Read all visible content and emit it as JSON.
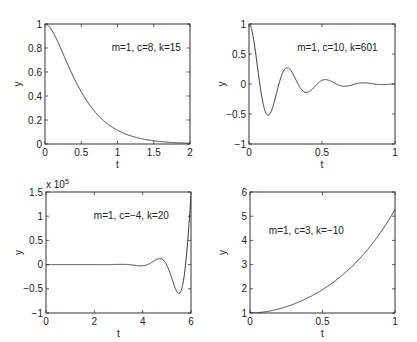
{
  "chart_data": [
    {
      "type": "line",
      "annotation": "m=1, c=8, k=15",
      "xlabel": "t",
      "ylabel": "y",
      "xlim": [
        0,
        2
      ],
      "ylim": [
        0,
        1
      ],
      "xticks": [
        "0",
        "0.5",
        "1",
        "1.5",
        "2"
      ],
      "yticks": [
        "0",
        "0.2",
        "0.4",
        "0.6",
        "0.8",
        "1"
      ],
      "grid": false,
      "series": [
        {
          "name": "y(t)",
          "x": [
            0,
            0.1,
            0.2,
            0.3,
            0.4,
            0.5,
            0.6,
            0.7,
            0.8,
            0.9,
            1.0,
            1.2,
            1.4,
            1.6,
            1.8,
            2.0
          ],
          "values": [
            1.0,
            0.943,
            0.82,
            0.681,
            0.551,
            0.435,
            0.337,
            0.257,
            0.195,
            0.148,
            0.114,
            0.066,
            0.037,
            0.021,
            0.011,
            0.006
          ]
        }
      ]
    },
    {
      "type": "line",
      "annotation": "m=1, c=10, k=601",
      "xlabel": "t",
      "ylabel": "y",
      "xlim": [
        0,
        1
      ],
      "ylim": [
        -1,
        1
      ],
      "xticks": [
        "0",
        "0.5",
        "1"
      ],
      "yticks": [
        "-1",
        "-0.5",
        "0",
        "0.5",
        "1"
      ],
      "grid": false,
      "series": [
        {
          "name": "y(t)",
          "x": [
            0,
            0.065,
            0.131,
            0.196,
            0.262,
            0.327,
            0.393,
            0.458,
            0.524,
            0.589,
            0.654,
            0.72,
            0.785,
            0.851,
            0.916,
            1.0
          ],
          "values": [
            1.0,
            0.0,
            -0.52,
            0.0,
            0.27,
            0.0,
            -0.14,
            0.0,
            0.073,
            0.0,
            -0.038,
            0.0,
            0.02,
            0.0,
            -0.01,
            0.005
          ]
        }
      ]
    },
    {
      "type": "line",
      "annotation": "m=1, c=−4, k=20",
      "xlabel": "t",
      "ylabel": "y",
      "y_multiplier": "x 10^5",
      "xlim": [
        0,
        6
      ],
      "ylim": [
        -1,
        1.5
      ],
      "xticks": [
        "0",
        "2",
        "4",
        "6"
      ],
      "yticks": [
        "-1",
        "-0.5",
        "0",
        "0.5",
        "1",
        "1.5"
      ],
      "grid": false,
      "series": [
        {
          "name": "y(t) / 1e5",
          "x": [
            0,
            1,
            2,
            3,
            3.5,
            4.0,
            4.5,
            4.75,
            5.0,
            5.25,
            5.5,
            5.75,
            6.0
          ],
          "values": [
            0.0,
            0.0,
            0.0,
            0.004,
            -0.002,
            -0.028,
            0.06,
            0.12,
            0.09,
            -0.25,
            -0.59,
            -0.2,
            1.42
          ]
        }
      ]
    },
    {
      "type": "line",
      "annotation": "m=1, c=3, k=−10",
      "xlabel": "t",
      "ylabel": "y",
      "xlim": [
        0,
        1
      ],
      "ylim": [
        1,
        6
      ],
      "xticks": [
        "0",
        "0.5",
        "1"
      ],
      "yticks": [
        "1",
        "2",
        "3",
        "4",
        "5",
        "6"
      ],
      "grid": false,
      "series": [
        {
          "name": "y(t)",
          "x": [
            0,
            0.1,
            0.2,
            0.3,
            0.4,
            0.5,
            0.6,
            0.7,
            0.8,
            0.9,
            1.0
          ],
          "values": [
            1.0,
            1.047,
            1.172,
            1.371,
            1.647,
            2.001,
            2.443,
            2.985,
            3.645,
            4.446,
            5.28
          ]
        }
      ]
    }
  ],
  "colors": {
    "axes": "#333333",
    "line": "#333333",
    "background": "#ffffff"
  }
}
